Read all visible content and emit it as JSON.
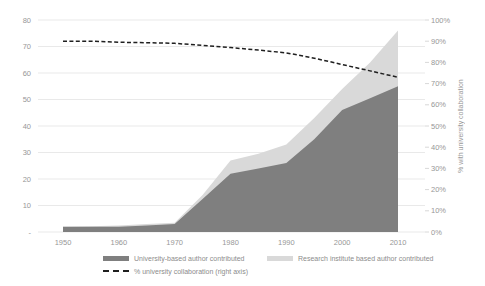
{
  "chart_data": {
    "type": "area",
    "title": "",
    "x": [
      1950,
      1955,
      1960,
      1965,
      1970,
      1975,
      1980,
      1985,
      1990,
      1995,
      2000,
      2005,
      2010
    ],
    "series": [
      {
        "name": "University-based author contributed",
        "axis": "left",
        "style": "area",
        "values": [
          2,
          2,
          2,
          2.5,
          3,
          12.5,
          22,
          24,
          26,
          35,
          46,
          50.5,
          55
        ]
      },
      {
        "name": "Research institute based author contributed",
        "axis": "left",
        "style": "area-stacked-increment",
        "values": [
          0,
          0.2,
          0.5,
          0.5,
          0.5,
          1.5,
          5,
          5.5,
          7,
          8,
          8,
          13.5,
          21
        ]
      },
      {
        "name": "% university collaboration (right axis)",
        "axis": "right",
        "style": "dashed-line",
        "values": [
          90,
          90,
          89.5,
          89.3,
          89,
          88,
          87,
          85.8,
          84.5,
          82,
          79,
          76,
          73
        ]
      }
    ],
    "left_axis": {
      "min": 0,
      "max": 80,
      "ticks": [
        "80",
        "70",
        "60",
        "50",
        "40",
        "30",
        "20",
        "10",
        "-"
      ]
    },
    "right_axis": {
      "min": 0,
      "max": 100,
      "ticks": [
        "100%",
        "90%",
        "80%",
        "70%",
        "60%",
        "50%",
        "40%",
        "30%",
        "20%",
        "10%",
        "0%"
      ],
      "label": "% with university collaboration"
    },
    "x_ticks": [
      "1950",
      "1960",
      "1970",
      "1980",
      "1990",
      "2000",
      "2010"
    ],
    "grid": true,
    "legend_position": "bottom",
    "colors": {
      "university": "#7f7f7f",
      "institute": "#d9d9d9",
      "line": "#1f1f1f",
      "grid": "#e9e9e9",
      "tick_stub": "#d8d8d8",
      "text": "#979797"
    }
  }
}
